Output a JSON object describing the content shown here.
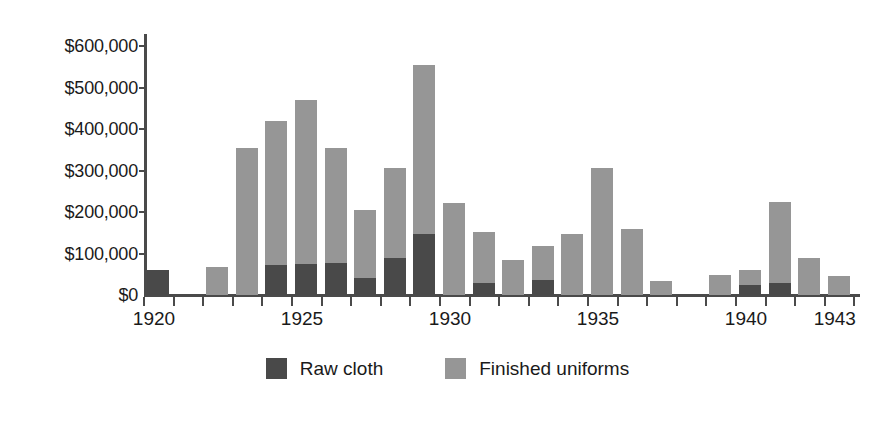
{
  "chart_data": {
    "type": "bar",
    "subtype": "stacked",
    "title": "",
    "xlabel": "",
    "ylabel": "",
    "grid": false,
    "legend_position": "bottom-center",
    "ylim": [
      0,
      600000
    ],
    "ytick_values": [
      0,
      100000,
      200000,
      300000,
      400000,
      500000,
      600000
    ],
    "ytick_labels": [
      "$0",
      "$100,000",
      "$200,000",
      "$300,000",
      "$400,000",
      "$500,000",
      "$600,000"
    ],
    "xlim": [
      1920,
      1943
    ],
    "xtick_labels": [
      "1920",
      "1925",
      "1930",
      "1935",
      "1940",
      "1943"
    ],
    "xtick_label_years": [
      1920,
      1925,
      1930,
      1935,
      1940,
      1943
    ],
    "categories": [
      1920,
      1921,
      1922,
      1923,
      1924,
      1925,
      1926,
      1927,
      1928,
      1929,
      1930,
      1931,
      1932,
      1933,
      1934,
      1935,
      1936,
      1937,
      1938,
      1939,
      1940,
      1941,
      1942,
      1943
    ],
    "series": [
      {
        "name": "Raw cloth",
        "color": "#494949",
        "values": [
          60000,
          0,
          0,
          0,
          72000,
          75000,
          78000,
          40000,
          88000,
          148000,
          0,
          28000,
          0,
          35000,
          0,
          0,
          0,
          0,
          0,
          0,
          25000,
          28000,
          0,
          0
        ]
      },
      {
        "name": "Finished uniforms",
        "color": "#969696",
        "values": [
          0,
          0,
          68000,
          355000,
          348000,
          395000,
          277000,
          165000,
          217000,
          407000,
          222000,
          125000,
          85000,
          82000,
          147000,
          305000,
          160000,
          33000,
          0,
          48000,
          35000,
          197000,
          88000,
          45000
        ]
      }
    ],
    "totals": [
      60000,
      0,
      68000,
      355000,
      420000,
      470000,
      355000,
      205000,
      305000,
      555000,
      222000,
      153000,
      85000,
      117000,
      147000,
      305000,
      160000,
      33000,
      0,
      48000,
      60000,
      225000,
      88000,
      45000
    ]
  },
  "legend": {
    "items": [
      {
        "label": "Raw cloth",
        "swatch": "raw-cloth-swatch"
      },
      {
        "label": "Finished uniforms",
        "swatch": "finished-uniforms-swatch"
      }
    ]
  }
}
